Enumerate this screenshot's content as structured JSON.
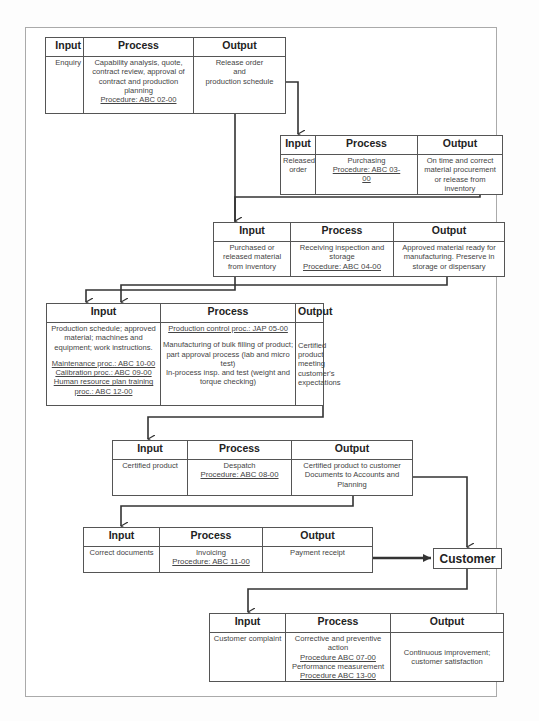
{
  "headers": {
    "input": "Input",
    "process": "Process",
    "output": "Output"
  },
  "steps": [
    {
      "input": "Enquiry",
      "process": "Capability analysis, quote, contract review, approval of contract and production planning",
      "procedure": "Procedure: ABC 02-00",
      "output_lines": [
        "Release order",
        "and",
        "production schedule"
      ]
    },
    {
      "input": "Released order",
      "process": "Purchasing",
      "procedure": "Procedure: ABC 03-00",
      "output": "On time and correct material procurement or release from inventory"
    },
    {
      "input": "Purchased or released material from inventory",
      "process": "Receiving inspection and storage",
      "procedure": "Procedure: ABC 04-00",
      "output": "Approved material ready for manufacturing. Preserve in storage or dispensary"
    },
    {
      "input": "Production schedule; approved material; machines and equipment; work instructions.",
      "input_procedures": [
        "Maintenance proc.: ABC 10-00",
        "Calibration proc.: ABC 09-00",
        "Human resource plan training proc.: ABC 12-00"
      ],
      "process_procedure": "Production control proc.: JAP 05-00",
      "process": "Manufacturing of bulk filling of product; part approval process (lab and micro test)",
      "process_2": "In-process insp. and test (weight and torque checking)",
      "output": "Certified product meeting customer's expectations"
    },
    {
      "input": "Certified product",
      "process": "Despatch",
      "procedure": "Procedure: ABC 08-00",
      "output": "Certified product to customer Documents to Accounts and Planning"
    },
    {
      "input": "Correct documents",
      "process": "Invoicing",
      "procedure": "Procedure: ABC 11-00",
      "output": "Payment receipt"
    },
    {
      "input": "Customer complaint",
      "process": "Corrective and preventive action",
      "procedure": "Procedure ABC 07-00",
      "process_2": "Performance measurement",
      "procedure_2": "Procedure ABC 13-00",
      "output": "Continuous improvement; customer satisfaction"
    }
  ],
  "customer": {
    "label": "Customer"
  },
  "colors": {
    "line": "#333333",
    "border": "#555555",
    "text": "#444444"
  }
}
